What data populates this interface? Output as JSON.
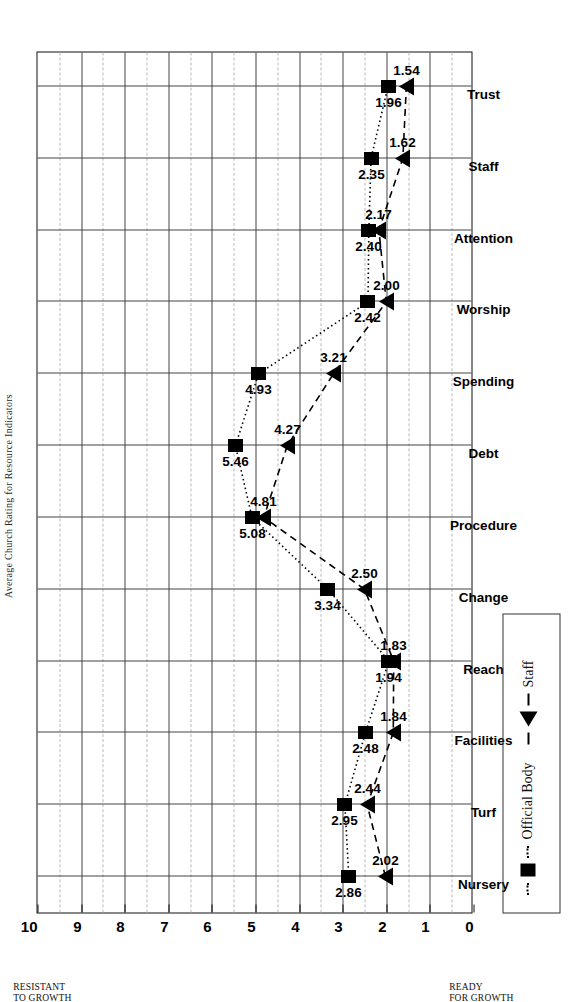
{
  "chart_data": {
    "type": "line",
    "title": "Average Church Rating for Resource Indicators",
    "categories": [
      "Nursery",
      "Turf",
      "Facilities",
      "Reach",
      "Change",
      "Procedure",
      "Debt",
      "Spending",
      "Worship",
      "Attention",
      "Staff",
      "Trust"
    ],
    "series": [
      {
        "name": "Official Body",
        "marker": "square",
        "line": "dotted",
        "values": [
          2.86,
          2.95,
          2.48,
          1.94,
          3.34,
          5.08,
          5.46,
          4.93,
          2.42,
          2.4,
          2.35,
          1.96
        ]
      },
      {
        "name": "Staff",
        "marker": "triangle",
        "line": "dashed",
        "values": [
          2.02,
          2.44,
          1.84,
          1.83,
          2.5,
          4.81,
          4.27,
          3.21,
          2.0,
          2.17,
          1.62,
          1.54
        ]
      }
    ],
    "value_axis": {
      "ticks": [
        0,
        1,
        2,
        3,
        4,
        5,
        6,
        7,
        8,
        9,
        10
      ],
      "min": 0,
      "max": 10,
      "low_caption": "READY\nFOR GROWTH",
      "high_caption": "RESISTANT\nTO GROWTH"
    },
    "xlabel": "",
    "ylabel": "",
    "grid": true,
    "legend_position": "bottom-left",
    "orientation": "rotated-90"
  },
  "axis_caption": {
    "high_line1": "RESISTANT",
    "high_line2": "TO GROWTH",
    "low_line1": "READY",
    "low_line2": "FOR GROWTH"
  },
  "legend": {
    "entries": [
      {
        "label": "Official Body",
        "marker": "square-marker",
        "line": "dotted-line"
      },
      {
        "label": "Staff",
        "marker": "triangle-marker",
        "line": "dashed-line"
      }
    ]
  }
}
